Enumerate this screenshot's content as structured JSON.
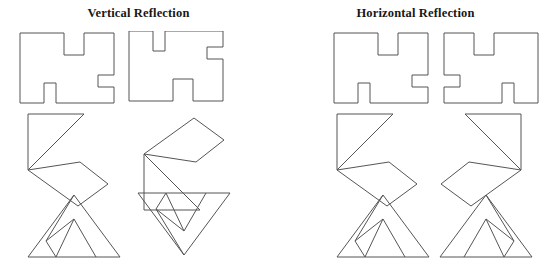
{
  "figure": {
    "type": "geometry-reflection-diagram",
    "background_color": "#ffffff",
    "stroke_color": "#555555",
    "text_color": "#181818",
    "width": 554,
    "height": 269
  },
  "panels": [
    {
      "id": "vertical",
      "title": "Vertical Reflection",
      "description": "Each pair shows a shape and its mirror image flipped about a horizontal axis (top to bottom).",
      "rows": [
        {
          "id": "blocky-polygon",
          "shape_name": "blocky-rectilinear-polygon",
          "original": {
            "label": "original-blocky-polygon",
            "points": "2,2 46,2 46,24 66,24 66,2 96,2 96,44 80,44 80,56 96,56 96,72 38,72 38,52 26,52 26,72 2,72"
          },
          "reflected": {
            "label": "reflected-blocky-polygon",
            "points": "2,70 46,70 46,48 66,48 66,70 96,70 96,28 80,28 80,16 96,16 96,0 38,0 38,20 26,20 26,0 2,0"
          }
        },
        {
          "id": "triangle-and-quadrilateral",
          "shape_name": "right-triangle-with-attached-quadrilateral",
          "original": {
            "label": "original-triangle-quad",
            "triangle": "4,4 60,4 4,60",
            "quad": "4,60 56,52 84,74 54,96"
          },
          "reflected": {
            "label": "reflected-triangle-quad",
            "triangle": "4,4 4,60 60,60",
            "quad": "4,4 56,12 84,-10 54,-32"
          }
        },
        {
          "id": "subdivided-triangle",
          "shape_name": "triangle-with-interior-subdivisions",
          "original": {
            "label": "original-subdivided-triangle",
            "outline": "48,2 94,64 2,64",
            "interior_lines": [
              "48,2 20,48",
              "20,48 48,26",
              "48,26 30,64",
              "48,26 70,64",
              "20,48 30,64"
            ]
          },
          "reflected": {
            "label": "reflected-subdivided-triangle",
            "outline": "48,64 94,2 2,2",
            "interior_lines": [
              "48,64 20,18",
              "20,18 48,40",
              "48,40 30,2",
              "48,40 70,2",
              "20,18 30,2"
            ]
          }
        }
      ]
    },
    {
      "id": "horizontal",
      "title": "Horizontal Reflection",
      "description": "Each pair shows a shape and its mirror image flipped about a vertical axis (left to right).",
      "rows": [
        {
          "id": "blocky-polygon",
          "shape_name": "blocky-rectilinear-polygon",
          "original": {
            "label": "original-blocky-polygon",
            "points": "2,2 46,2 46,24 66,24 66,2 96,2 96,44 80,44 80,56 96,56 96,72 38,72 38,52 26,52 26,72 2,72"
          },
          "reflected": {
            "label": "reflected-blocky-polygon",
            "points": "96,2 52,2 52,24 32,24 32,2 2,2 2,44 18,44 18,56 2,56 2,72 60,72 60,52 72,52 72,72 96,72"
          }
        },
        {
          "id": "triangle-and-quadrilateral",
          "shape_name": "right-triangle-with-attached-quadrilateral",
          "original": {
            "label": "original-triangle-quad",
            "triangle": "4,4 60,4 4,60",
            "quad": "4,60 56,52 84,74 54,96"
          },
          "reflected": {
            "label": "reflected-triangle-quad",
            "triangle": "84,4 28,4 84,60",
            "quad": "84,60 32,52 4,74 34,96"
          }
        },
        {
          "id": "subdivided-triangle",
          "shape_name": "triangle-with-interior-subdivisions",
          "original": {
            "label": "original-subdivided-triangle",
            "outline": "48,2 94,64 2,64",
            "interior_lines": [
              "48,2 20,48",
              "20,48 48,26",
              "48,26 30,64",
              "48,26 70,64",
              "20,48 30,64"
            ]
          },
          "reflected": {
            "label": "reflected-subdivided-triangle",
            "outline": "48,2 2,64 94,64",
            "interior_lines": [
              "48,2 76,48",
              "76,48 48,26",
              "48,26 66,64",
              "48,26 26,64",
              "76,48 66,64"
            ]
          }
        }
      ]
    }
  ]
}
